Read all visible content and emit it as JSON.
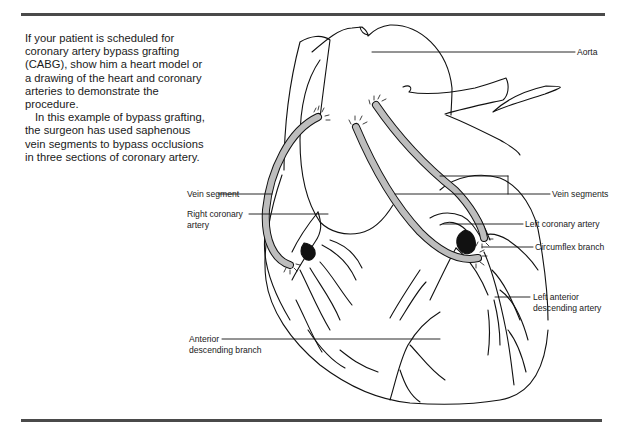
{
  "intro": {
    "paragraph1": "If your patient is scheduled for coronary artery bypass grafting (CABG), show him a heart model or a drawing of the heart and coronary arteries to demonstrate the procedure.",
    "paragraph2": "In this example of bypass grafting, the surgeon has used saphenous vein segments to bypass occlusions in three sections of coronary artery."
  },
  "labels": {
    "aorta": "Aorta",
    "vein_segment": "Vein segment",
    "vein_segments": "Vein segments",
    "right_coronary_artery_1": "Right coronary",
    "right_coronary_artery_2": "artery",
    "left_coronary_artery": "Left coronary artery",
    "circumflex_branch": "Circumflex branch",
    "left_anterior_descending_1": "Left anterior",
    "left_anterior_descending_2": "descending artery",
    "anterior_descending_branch_1": "Anterior",
    "anterior_descending_branch_2": "descending branch"
  },
  "colors": {
    "graft_fill": "#bdbdbd",
    "occlusion": "#111111",
    "rule": "#4a4a4a"
  }
}
